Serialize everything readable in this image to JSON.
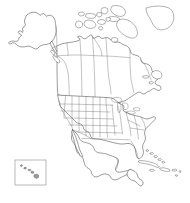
{
  "map": {
    "title": "North America blank outline map",
    "projection_note": "",
    "background_color": "#ffffff",
    "coastline_color": "#4a4a4a",
    "internal_border_color": "#6b6b6b",
    "island_fill_color": "#ffffff",
    "inset_frame_color": "#8a8a8a",
    "inset_island_color": "#9a9a9a",
    "width": 190,
    "height": 203,
    "countries": [
      {
        "name": "United States of America",
        "id": "usa",
        "has_internal_borders": true
      },
      {
        "name": "Canada",
        "id": "canada",
        "has_internal_borders": true
      },
      {
        "name": "Mexico",
        "id": "mexico",
        "has_internal_borders": false
      },
      {
        "name": "Guatemala",
        "id": "guatemala",
        "has_internal_borders": false
      },
      {
        "name": "Belize",
        "id": "belize",
        "has_internal_borders": false
      },
      {
        "name": "Honduras",
        "id": "honduras",
        "has_internal_borders": false
      },
      {
        "name": "Greenland",
        "id": "greenland",
        "has_internal_borders": false
      }
    ],
    "regions": [
      {
        "name": "Alaska",
        "id": "alaska"
      },
      {
        "name": "Canadian Arctic Archipelago",
        "id": "arctic-archipelago"
      },
      {
        "name": "Baffin Island",
        "id": "baffin-island"
      },
      {
        "name": "Victoria Island",
        "id": "victoria-island"
      },
      {
        "name": "Newfoundland",
        "id": "newfoundland"
      },
      {
        "name": "Baja California",
        "id": "baja-california"
      },
      {
        "name": "Yucatan Peninsula",
        "id": "yucatan"
      },
      {
        "name": "Florida Peninsula",
        "id": "florida"
      },
      {
        "name": "Great Lakes",
        "id": "great-lakes"
      }
    ],
    "caribbean_islands": [
      {
        "name": "Cuba",
        "id": "cuba"
      },
      {
        "name": "Hispaniola",
        "id": "hispaniola"
      },
      {
        "name": "Jamaica",
        "id": "jamaica"
      },
      {
        "name": "Puerto Rico",
        "id": "puerto-rico"
      },
      {
        "name": "Bahamas",
        "id": "bahamas"
      }
    ],
    "inset": {
      "label": "Hawaii",
      "id": "hawaii-inset",
      "islands": [
        "Kauai",
        "Oahu",
        "Molokai",
        "Maui",
        "Hawaii"
      ]
    },
    "legend": null,
    "labels": []
  }
}
